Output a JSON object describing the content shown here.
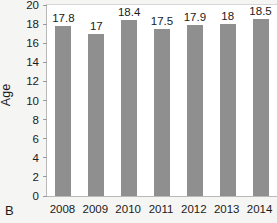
{
  "panel": {
    "label": "B"
  },
  "chart_data": {
    "type": "bar",
    "title": "",
    "subtitle": "",
    "xlabel": "",
    "ylabel": "Age",
    "categories": [
      "2008",
      "2009",
      "2010",
      "2011",
      "2012",
      "2013",
      "2014"
    ],
    "values": [
      17.8,
      17,
      18.4,
      17.5,
      17.9,
      18,
      18.5
    ],
    "data_labels": [
      "17.8",
      "17",
      "18.4",
      "17.5",
      "17.9",
      "18",
      "18.5"
    ],
    "ylim": [
      0,
      20
    ],
    "ytick_values": [
      0,
      2,
      4,
      6,
      8,
      10,
      12,
      14,
      16,
      18,
      20
    ],
    "ytick_labels": [
      "0",
      "2",
      "4",
      "6",
      "8",
      "10",
      "12",
      "14",
      "16",
      "18",
      "20"
    ],
    "grid": false,
    "legend": null,
    "bar_color": "#8f8f8f",
    "plot_background": "#ffffff",
    "figure_background": "#f5f5f3",
    "text_color": "#1b1b1b"
  }
}
